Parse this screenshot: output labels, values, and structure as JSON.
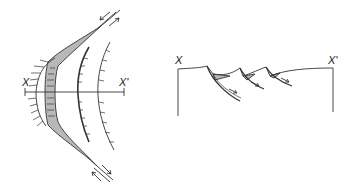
{
  "plan_view": {
    "section_start_label": "X",
    "section_end_label": "X'",
    "shade_color": "#b8b8b8",
    "line_color": "#333333"
  },
  "cross_section": {
    "left_label": "X",
    "right_label": "X'",
    "shade_color": "#b8b8b8",
    "line_color": "#333333"
  }
}
